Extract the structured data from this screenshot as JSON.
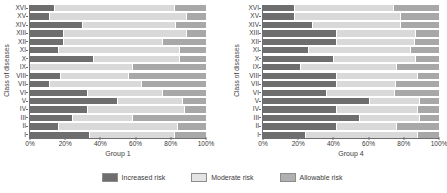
{
  "chart_data": [
    {
      "type": "bar",
      "orientation": "horizontal",
      "stacked": true,
      "normalized": true,
      "panel": "left",
      "title": "",
      "xlabel": "Group 1",
      "ylabel": "Class of diseases",
      "xlim": [
        0,
        100
      ],
      "xticks": [
        0,
        20,
        40,
        60,
        80,
        100
      ],
      "xticklabels": [
        "0%",
        "20%",
        "40%",
        "60%",
        "80%",
        "100%"
      ],
      "grid": false,
      "legend_position": "bottom-center-shared",
      "categories": [
        "XVI",
        "XV",
        "XIV",
        "XIII",
        "XII",
        "XI",
        "X",
        "IX",
        "VIII",
        "VII",
        "VI",
        "V",
        "IV",
        "III",
        "II",
        "I"
      ],
      "series": [
        {
          "name": "Increased risk",
          "color": "#6e6e6e",
          "values": [
            14,
            11,
            30,
            19,
            19,
            16,
            36,
            0,
            17,
            11,
            33,
            50,
            33,
            24,
            16,
            34
          ]
        },
        {
          "name": "Moderate risk",
          "color": "#d9d9d9",
          "values": [
            68,
            78,
            53,
            70,
            56,
            69,
            49,
            58,
            39,
            52,
            42,
            37,
            55,
            34,
            68,
            48
          ]
        },
        {
          "name": "Allowable risk",
          "color": "#a8a8a8",
          "values": [
            18,
            11,
            17,
            11,
            25,
            15,
            15,
            42,
            44,
            37,
            25,
            13,
            12,
            42,
            16,
            18
          ]
        }
      ]
    },
    {
      "type": "bar",
      "orientation": "horizontal",
      "stacked": true,
      "normalized": true,
      "panel": "right",
      "title": "",
      "xlabel": "Group 4",
      "ylabel": "Class of diseases",
      "xlim": [
        0,
        100
      ],
      "xticks": [
        0,
        20,
        40,
        60,
        80,
        100
      ],
      "xticklabels": [
        "0%",
        "20%",
        "40%",
        "60%",
        "80%",
        "100%"
      ],
      "grid": false,
      "legend_position": "bottom-center-shared",
      "categories": [
        "XVI",
        "XV",
        "XIV",
        "XIII",
        "XII",
        "XI",
        "X",
        "IX",
        "VIII",
        "VII",
        "VI",
        "V",
        "IV",
        "III",
        "II",
        "I"
      ],
      "series": [
        {
          "name": "Increased risk",
          "color": "#6e6e6e",
          "values": [
            18,
            18,
            28,
            42,
            42,
            26,
            40,
            21,
            42,
            42,
            36,
            61,
            42,
            55,
            42,
            24
          ]
        },
        {
          "name": "Moderate risk",
          "color": "#d9d9d9",
          "values": [
            56,
            60,
            50,
            45,
            44,
            58,
            47,
            55,
            46,
            33,
            39,
            28,
            46,
            34,
            34,
            64
          ]
        },
        {
          "name": "Allowable risk",
          "color": "#a8a8a8",
          "values": [
            26,
            22,
            22,
            13,
            14,
            16,
            13,
            24,
            12,
            25,
            25,
            11,
            12,
            11,
            24,
            12
          ]
        }
      ]
    }
  ],
  "legend": {
    "items": [
      {
        "label": "Increased risk",
        "color": "#6e6e6e"
      },
      {
        "label": "Moderate risk",
        "color": "#e4e4e4"
      },
      {
        "label": "Allowable risk",
        "color": "#b0b0b0"
      }
    ]
  }
}
